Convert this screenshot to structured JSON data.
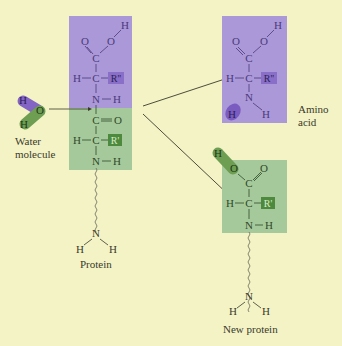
{
  "diagram": {
    "type": "chemical-reaction",
    "colors": {
      "background": "#f3f3c6",
      "purple_block": "#ab98d8",
      "green_block": "#a6c99c",
      "purple_atom": "#8464c4",
      "green_atom": "#6e9e52",
      "r_double_prime_box": "#8a6fc8",
      "r_prime_box": "#4e8a3e",
      "text": "#3a3a2a",
      "purple_text": "#4a3a7a",
      "green_text": "#2f4a28"
    },
    "left_protein": {
      "purple_segment": {
        "atoms": [
          "O",
          "O",
          "H",
          "C",
          "H",
          "C",
          "R''",
          "N",
          "H"
        ]
      },
      "green_segment": {
        "atoms": [
          "C",
          "O",
          "H",
          "C",
          "R'",
          "N",
          "H"
        ]
      },
      "terminal": {
        "atoms": [
          "N",
          "H",
          "H"
        ]
      },
      "label": "Protein"
    },
    "water": {
      "atoms": [
        "H",
        "O",
        "H"
      ],
      "label_line1": "Water",
      "label_line2": "molecule"
    },
    "products": {
      "amino_acid": {
        "atoms": [
          "O",
          "O",
          "H",
          "C",
          "H",
          "C",
          "R''",
          "N",
          "H",
          "H"
        ],
        "label_line1": "Amino",
        "label_line2": "acid"
      },
      "new_protein": {
        "atoms": [
          "H",
          "O",
          "O",
          "C",
          "H",
          "C",
          "R'",
          "N",
          "H"
        ],
        "terminal": {
          "atoms": [
            "N",
            "H",
            "H"
          ]
        },
        "label": "New protein"
      }
    },
    "arrows": [
      "to-amino-acid",
      "to-new-protein"
    ]
  }
}
